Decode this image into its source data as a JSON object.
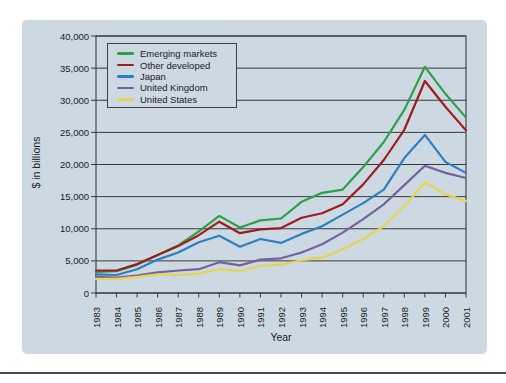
{
  "figure": {
    "y_axis_title": "$ in billions",
    "x_axis_title": "Year"
  },
  "colors": {
    "panel_background": "#cdd9e2",
    "axis_and_grid": "#3a3a3a",
    "text": "#1a1a1a",
    "page_rule": "#4a4a4a"
  },
  "chart_data": {
    "type": "line",
    "title": "",
    "xlabel": "Year",
    "ylabel": "$ in billions",
    "x": [
      1983,
      1984,
      1985,
      1986,
      1987,
      1988,
      1989,
      1990,
      1991,
      1992,
      1993,
      1994,
      1995,
      1996,
      1997,
      1998,
      1999,
      2000,
      2001
    ],
    "x_tick_labels": [
      "1983",
      "1984",
      "1985",
      "1986",
      "1987",
      "1988",
      "1989",
      "1990",
      "1991",
      "1992",
      "1993",
      "1994",
      "1995",
      "1996",
      "1997",
      "1998",
      "1999",
      "2000",
      "2001"
    ],
    "y_ticks": [
      0,
      5000,
      10000,
      15000,
      20000,
      25000,
      30000,
      35000,
      40000
    ],
    "y_tick_labels": [
      "0",
      "5,000",
      "10,000",
      "15,000",
      "20,000",
      "25,000",
      "30,000",
      "35,000",
      "40,000"
    ],
    "ylim": [
      0,
      40000
    ],
    "grid": "horizontal",
    "legend_position": "upper-left-inside",
    "series": [
      {
        "name": "Emerging markets",
        "color": "#2f9e49",
        "values": [
          3300,
          3400,
          4400,
          5900,
          7400,
          9600,
          12000,
          10200,
          11300,
          11600,
          14200,
          15600,
          16100,
          19600,
          23500,
          28500,
          35200,
          31000,
          27300
        ]
      },
      {
        "name": "Other developed",
        "color": "#9e1b1e",
        "values": [
          3500,
          3500,
          4500,
          5900,
          7300,
          9000,
          11100,
          9300,
          9900,
          10100,
          11700,
          12400,
          13800,
          16900,
          20700,
          25400,
          33000,
          29000,
          25300
        ]
      },
      {
        "name": "Japan",
        "color": "#2e7fc2",
        "values": [
          2900,
          2800,
          3700,
          5200,
          6300,
          7900,
          8900,
          7200,
          8400,
          7800,
          9200,
          10400,
          12200,
          14000,
          16100,
          21000,
          24600,
          20400,
          18700
        ]
      },
      {
        "name": "United Kingdom",
        "color": "#75619b",
        "values": [
          2500,
          2400,
          2700,
          3200,
          3500,
          3700,
          4800,
          4300,
          5200,
          5400,
          6300,
          7600,
          9400,
          11500,
          13800,
          16800,
          19800,
          18700,
          17900
        ]
      },
      {
        "name": "United States",
        "color": "#e6d44f",
        "values": [
          2200,
          2200,
          2500,
          2900,
          2800,
          3000,
          3700,
          3400,
          4200,
          4400,
          5100,
          5500,
          6800,
          8400,
          10400,
          13500,
          17200,
          15400,
          14300
        ]
      }
    ]
  }
}
